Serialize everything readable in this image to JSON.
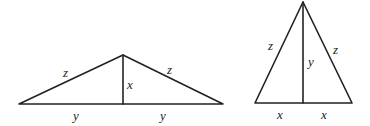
{
  "figures": [
    {
      "name": "wide-isosceles-triangle",
      "apex": [
        123,
        55
      ],
      "base_left": [
        19,
        104
      ],
      "base_right": [
        223,
        104
      ],
      "foot": [
        123,
        104
      ],
      "labels": {
        "left_side": "z",
        "right_side": "z",
        "altitude": "x",
        "base_left_half": "y",
        "base_right_half": "y"
      }
    },
    {
      "name": "tall-isosceles-triangle",
      "apex": [
        303,
        2
      ],
      "base_left": [
        255,
        103
      ],
      "base_right": [
        352,
        103
      ],
      "foot": [
        303,
        103
      ],
      "labels": {
        "left_side": "z",
        "right_side": "z",
        "altitude": "y",
        "base_left_half": "x",
        "base_right_half": "x"
      }
    }
  ],
  "colors": {
    "stroke": "#222222",
    "background": "#ffffff"
  }
}
